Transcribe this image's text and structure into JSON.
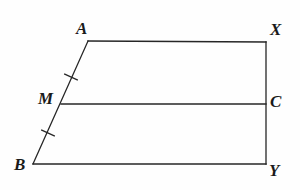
{
  "figure": {
    "background_color": "#fefefe",
    "stroke_color": "#262626",
    "label_color": "#1a1a1a",
    "stroke_width": 1.3,
    "labels": {
      "a": "A",
      "x": "X",
      "m": "M",
      "c": "C",
      "b": "B",
      "y": "Y"
    },
    "vertices": {
      "A": {
        "x": 88,
        "y": 41
      },
      "X": {
        "x": 266,
        "y": 42
      },
      "C": {
        "x": 266,
        "y": 104
      },
      "Y": {
        "x": 266,
        "y": 164
      },
      "B": {
        "x": 33,
        "y": 164
      },
      "M": {
        "x": 61,
        "y": 104
      }
    },
    "segments": [
      {
        "name": "segment-AX",
        "from": "A",
        "to": "X"
      },
      {
        "name": "segment-XY",
        "from": "X",
        "to": "Y"
      },
      {
        "name": "segment-BY",
        "from": "B",
        "to": "Y"
      },
      {
        "name": "segment-AB",
        "from": "A",
        "to": "B"
      },
      {
        "name": "segment-MC",
        "from": "M",
        "to": "C"
      }
    ],
    "tick_marks": [
      {
        "name": "tick-mark-AM",
        "cx": 71,
        "cy": 77,
        "angle_deg": 24,
        "length": 15
      },
      {
        "name": "tick-mark-MB",
        "cx": 48,
        "cy": 133,
        "angle_deg": 24,
        "length": 15
      }
    ]
  }
}
